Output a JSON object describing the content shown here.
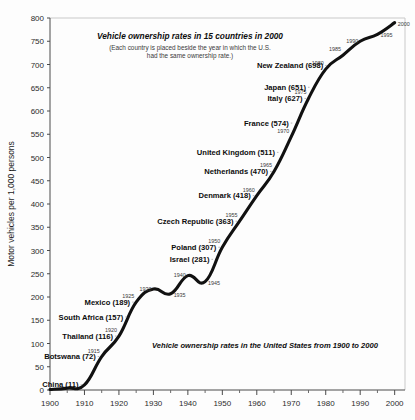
{
  "chart_data": {
    "type": "line",
    "title": "Vehicle ownership rates in 15 countries in 2000",
    "subtitle_line1": "(Each country is placed beside the year in which the U.S.",
    "subtitle_line2": "had the same ownership rate.)",
    "caption": "Vehicle ownership rates in the United States from 1900 to 2000",
    "xlabel": "",
    "ylabel": "Motor vehicles per 1,000 persons",
    "xlim": [
      1900,
      2003
    ],
    "ylim": [
      0,
      800
    ],
    "ytick_step": 50,
    "xtick_step": 10,
    "xtick_minor_step": 5,
    "grid": false,
    "legend": "none",
    "series": [
      {
        "name": "United States vehicle ownership rate",
        "x": [
          1900,
          1905,
          1910,
          1915,
          1920,
          1925,
          1930,
          1935,
          1940,
          1945,
          1950,
          1955,
          1960,
          1965,
          1970,
          1975,
          1980,
          1985,
          1990,
          1995,
          2000
        ],
        "values": [
          1,
          4,
          11,
          72,
          116,
          189,
          217,
          207,
          246,
          233,
          307,
          363,
          418,
          470,
          545,
          627,
          690,
          720,
          750,
          765,
          790
        ]
      }
    ],
    "ytick_labels": [
      "0",
      "50",
      "100",
      "150",
      "200",
      "250",
      "300",
      "350",
      "400",
      "450",
      "500",
      "550",
      "600",
      "650",
      "700",
      "750",
      "800"
    ],
    "xtick_labels": [
      "1900",
      "1910",
      "1920",
      "1930",
      "1940",
      "1950",
      "1960",
      "1970",
      "1980",
      "1990",
      "2000"
    ],
    "curve_year_markers": [
      {
        "year": "1915",
        "x": 1915,
        "y": 72
      },
      {
        "year": "1920",
        "x": 1920,
        "y": 116
      },
      {
        "year": "1925",
        "x": 1925,
        "y": 189
      },
      {
        "year": "1930",
        "x": 1930,
        "y": 217
      },
      {
        "year": "1935",
        "x": 1935,
        "y": 207
      },
      {
        "year": "1940",
        "x": 1940,
        "y": 246
      },
      {
        "year": "1945",
        "x": 1945,
        "y": 233
      },
      {
        "year": "1950",
        "x": 1950,
        "y": 307
      },
      {
        "year": "1955",
        "x": 1955,
        "y": 363
      },
      {
        "year": "1960",
        "x": 1960,
        "y": 418
      },
      {
        "year": "1965",
        "x": 1965,
        "y": 470
      },
      {
        "year": "1970",
        "x": 1970,
        "y": 545
      },
      {
        "year": "1975",
        "x": 1975,
        "y": 627
      },
      {
        "year": "1980",
        "x": 1980,
        "y": 690
      },
      {
        "year": "1985",
        "x": 1985,
        "y": 720
      },
      {
        "year": "1990",
        "x": 1990,
        "y": 750
      },
      {
        "year": "1995",
        "x": 1995,
        "y": 765
      },
      {
        "year": "2000",
        "x": 2000,
        "y": 790
      }
    ],
    "country_annotations": [
      {
        "label": "New Zealand (698)",
        "value": 698,
        "match_year": 1981
      },
      {
        "label": "Japan (651)",
        "value": 651,
        "match_year": 1976
      },
      {
        "label": "Italy (627)",
        "value": 627,
        "match_year": 1975
      },
      {
        "label": "France (574)",
        "value": 574,
        "match_year": 1971
      },
      {
        "label": "United Kingdom (511)",
        "value": 511,
        "match_year": 1967
      },
      {
        "label": "Netherlands (470)",
        "value": 470,
        "match_year": 1965
      },
      {
        "label": "Denmark (418)",
        "value": 418,
        "match_year": 1960
      },
      {
        "label": "Czech Republic (363)",
        "value": 363,
        "match_year": 1955
      },
      {
        "label": "Poland (307)",
        "value": 307,
        "match_year": 1950
      },
      {
        "label": "Israel (281)",
        "value": 281,
        "match_year": 1948
      },
      {
        "label": "Mexico (189)",
        "value": 189,
        "match_year": 1925
      },
      {
        "label": "South Africa (157)",
        "value": 157,
        "match_year": 1923
      },
      {
        "label": "Thailand (116)",
        "value": 116,
        "match_year": 1920
      },
      {
        "label": "Botswana (72)",
        "value": 72,
        "match_year": 1915
      },
      {
        "label": "China (11)",
        "value": 11,
        "match_year": 1910
      }
    ]
  }
}
